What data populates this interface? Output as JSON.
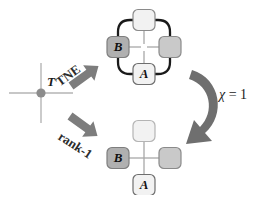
{
  "figure": {
    "background": "#ffffff"
  },
  "colors": {
    "node_white": "#f2f2f2",
    "node_light_gray": "#c9c9c9",
    "node_mid_gray": "#b0b0b0",
    "node_border": "#8a8a8a",
    "loop_black": "#1a1a1a",
    "bond_gray": "#a8a8a8",
    "arrow_gray": "#7a7a7a",
    "arrow_dark": "#6b6b6b",
    "axis_gray": "#b5b5b5",
    "dot_gray": "#8c8c8c",
    "text_black": "#111111"
  },
  "source": {
    "name": "T",
    "label": "T",
    "marker": "cross-with-dot",
    "dot_x": 41,
    "dot_y": 93,
    "cross_half_w": 32,
    "cross_half_h": 30
  },
  "arrows": {
    "tne": {
      "label": "TNE",
      "rotation_deg": -38,
      "label_x": 62,
      "label_y": 74,
      "direction": "up-right"
    },
    "rank1": {
      "label": "rank-1",
      "rotation_deg": 32,
      "label_x": 57,
      "label_y": 128,
      "direction": "down-right"
    },
    "chi": {
      "label_symbol": "χ",
      "label_rest": " = 1",
      "label_full": "χ = 1",
      "label_x": 219,
      "label_y": 88,
      "direction": "curved-clockwise"
    }
  },
  "networks": [
    {
      "id": "tne-network",
      "name": "tne-tensor-network",
      "center_x": 144,
      "center_y": 47,
      "has_loop": true,
      "loop_color": "#1a1a1a",
      "nodes": [
        {
          "id": "top",
          "name": "node-top",
          "label": "",
          "fill": "#f2f2f2",
          "x": 144,
          "y": 20,
          "w": 22,
          "h": 21
        },
        {
          "id": "left",
          "name": "node-b",
          "label": "B",
          "fill": "#b0b0b0",
          "x": 118,
          "y": 47,
          "w": 22,
          "h": 21
        },
        {
          "id": "right",
          "name": "node-right",
          "label": "",
          "fill": "#c9c9c9",
          "x": 170,
          "y": 47,
          "w": 22,
          "h": 21
        },
        {
          "id": "bottom",
          "name": "node-a",
          "label": "A",
          "fill": "#f2f2f2",
          "x": 144,
          "y": 74,
          "w": 22,
          "h": 21
        }
      ]
    },
    {
      "id": "rank1-network",
      "name": "rank-1-tensor-network",
      "center_x": 144,
      "center_y": 158,
      "has_loop": false,
      "loop_color": "",
      "nodes": [
        {
          "id": "top",
          "name": "node-top",
          "label": "",
          "fill": "#f2f2f2",
          "x": 144,
          "y": 131,
          "w": 22,
          "h": 21
        },
        {
          "id": "left",
          "name": "node-b",
          "label": "B",
          "fill": "#b0b0b0",
          "x": 118,
          "y": 158,
          "w": 22,
          "h": 21
        },
        {
          "id": "right",
          "name": "node-right",
          "label": "",
          "fill": "#c9c9c9",
          "x": 170,
          "y": 158,
          "w": 22,
          "h": 21
        },
        {
          "id": "bottom",
          "name": "node-a",
          "label": "A",
          "fill": "#f2f2f2",
          "x": 144,
          "y": 185,
          "w": 22,
          "h": 21
        }
      ]
    }
  ]
}
